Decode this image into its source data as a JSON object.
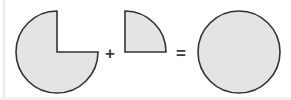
{
  "diagram": {
    "title": "Three-quarter disc plus quarter disc equals full disc",
    "background_color": "#ffffff",
    "shape_fill_color": "#e4e4e4",
    "shape_stroke_color": "#333333",
    "symbol_color": "#3b3b3b",
    "margin_stripe_color": "#ebebeb",
    "equation_text": "three-quarter circle + quarter circle = full circle",
    "operators": {
      "plus": "+",
      "equals": "="
    },
    "shapes": [
      {
        "id": "three-quarter-disc",
        "name": "Three-quarter disc",
        "description": "Circle with the top-right quadrant removed",
        "center_x": 57,
        "center_y": 52,
        "radius": 41,
        "missing_quadrant": "top-right",
        "fraction": "3/4"
      },
      {
        "id": "quarter-disc",
        "name": "Quarter disc",
        "description": "Quarter circle with right angle at bottom-left",
        "corner_x": 125,
        "corner_y": 52,
        "radius": 41,
        "quadrant": "top-right",
        "fraction": "1/4"
      },
      {
        "id": "full-disc",
        "name": "Full disc",
        "description": "Complete filled circle",
        "center_x": 239,
        "center_y": 52,
        "radius": 41,
        "fraction": "1"
      }
    ],
    "operator_positions": {
      "plus_x": 110,
      "plus_y": 53,
      "equals_x": 181,
      "equals_y": 53
    }
  }
}
